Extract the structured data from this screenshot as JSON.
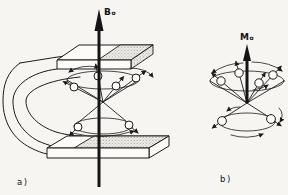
{
  "figure": {
    "colors": {
      "background": "#f6f5f1",
      "ink": "#1b1b1b",
      "stipple_dot": "#6e6e6e"
    },
    "panel_a": {
      "caption": "a)",
      "field_vector": {
        "symbol": "B",
        "subscript": "o"
      }
    },
    "panel_b": {
      "caption": "b)",
      "field_vector": {
        "symbol": "M",
        "subscript": "o"
      }
    }
  }
}
